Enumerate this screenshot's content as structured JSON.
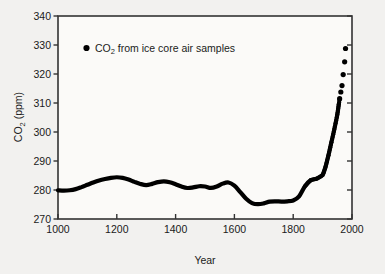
{
  "chart_data": {
    "type": "line",
    "title": "",
    "xlabel": "Year",
    "ylabel_main": "CO",
    "ylabel_sub": "2",
    "ylabel_unit": " (ppm)",
    "ylabel_full": "CO2 (ppm)",
    "xlim": [
      1000,
      2000
    ],
    "ylim": [
      270,
      340
    ],
    "xticks": [
      1000,
      1200,
      1400,
      1600,
      1800,
      2000
    ],
    "xtick_labels": [
      "1000",
      "1200",
      "1400",
      "1600",
      "1800",
      "2000"
    ],
    "yticks": [
      270,
      280,
      290,
      300,
      310,
      320,
      330,
      340
    ],
    "ytick_labels": [
      "270",
      "280",
      "290",
      "300",
      "310",
      "320",
      "330",
      "340"
    ],
    "grid": false,
    "frame": "box",
    "legend": {
      "position": "upper-left-inside",
      "marker": "filled-circle",
      "entries": [
        {
          "label_main": "CO",
          "label_sub": "2",
          "label_rest": " from ice core air samples",
          "label_full": "CO2 from ice core air samples",
          "color": "#000000",
          "marker": "filled-circle"
        }
      ]
    },
    "series": [
      {
        "name": "CO2 from ice core air samples",
        "color": "#000000",
        "style": "thick-line-with-dense-markers",
        "x": [
          1000,
          1020,
          1040,
          1060,
          1080,
          1100,
          1120,
          1140,
          1160,
          1180,
          1200,
          1220,
          1240,
          1260,
          1280,
          1300,
          1320,
          1340,
          1360,
          1380,
          1400,
          1420,
          1440,
          1460,
          1480,
          1500,
          1520,
          1540,
          1560,
          1580,
          1600,
          1620,
          1640,
          1660,
          1680,
          1700,
          1720,
          1740,
          1760,
          1780,
          1800,
          1820,
          1840,
          1860,
          1880,
          1900,
          1910,
          1920,
          1930,
          1940,
          1950,
          1955,
          1958,
          1962,
          1966,
          1970,
          1975,
          1978
        ],
        "y": [
          279.9,
          279.8,
          279.9,
          280.3,
          281.0,
          281.8,
          282.6,
          283.3,
          283.8,
          284.2,
          284.4,
          284.2,
          283.6,
          282.8,
          282.1,
          281.7,
          282.1,
          282.7,
          283.0,
          282.7,
          282.0,
          281.2,
          280.7,
          280.9,
          281.3,
          281.2,
          280.7,
          281.2,
          282.2,
          282.6,
          281.5,
          279.3,
          277.0,
          275.5,
          275.1,
          275.4,
          276.0,
          276.1,
          276.0,
          276.1,
          276.4,
          277.8,
          281.3,
          283.4,
          283.9,
          285.2,
          288.0,
          292.0,
          296.5,
          301.0,
          306.0,
          309.5,
          311.5,
          313.8,
          316.0,
          319.8,
          324.2,
          328.8
        ]
      }
    ],
    "annotations": []
  },
  "style": {
    "background": "#f2f1ef",
    "plot_background": "#fbfaf8",
    "axis_color": "#333333",
    "data_color": "#000000",
    "text_color": "#1a1a1a"
  }
}
